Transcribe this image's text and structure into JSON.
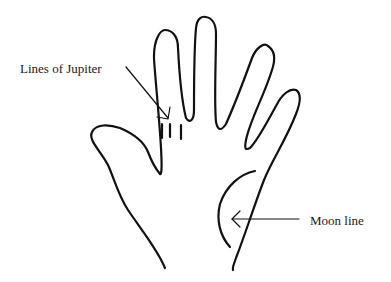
{
  "diagram": {
    "labels": {
      "jupiter": "Lines of Jupiter",
      "moon": "Moon line"
    },
    "colors": {
      "stroke": "#111111",
      "background": "#ffffff",
      "text": "#1a1a1a"
    }
  }
}
